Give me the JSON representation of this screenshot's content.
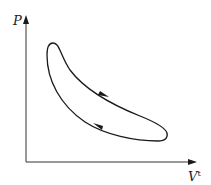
{
  "diagram": {
    "type": "P-V cycle diagram",
    "axes": {
      "y_label": "P",
      "x_label": "V",
      "x_label_superscript": "t"
    },
    "cycle": {
      "direction": "clockwise",
      "arrows": [
        {
          "position": "upper-curve",
          "direction": "down-right"
        },
        {
          "position": "lower-curve",
          "direction": "up-left"
        }
      ]
    },
    "colors": {
      "line": "#1a1a1a",
      "axis": "#333333",
      "background": "#ffffff"
    }
  }
}
